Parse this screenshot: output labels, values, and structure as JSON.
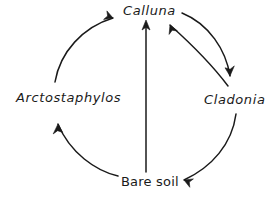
{
  "diagram": {
    "type": "cyclic-succession-diagram",
    "background_color": "#ffffff",
    "stroke_color": "#1a1a1a",
    "nodes": [
      {
        "id": "calluna",
        "label": "Calluna",
        "style": "italic",
        "position": "top"
      },
      {
        "id": "cladonia",
        "label": "Cladonia",
        "style": "italic",
        "position": "right"
      },
      {
        "id": "bare_soil",
        "label": "Bare soil",
        "style": "upright",
        "position": "bottom"
      },
      {
        "id": "arctostaphylos",
        "label": "Arctostaphylos",
        "style": "italic",
        "position": "left"
      }
    ],
    "edges": [
      {
        "from": "bare_soil",
        "to": "arctostaphylos",
        "shape": "arc",
        "direction": "counterclockwise"
      },
      {
        "from": "arctostaphylos",
        "to": "calluna",
        "shape": "arc",
        "direction": "counterclockwise"
      },
      {
        "from": "calluna",
        "to": "cladonia",
        "shape": "arc",
        "direction": "clockwise"
      },
      {
        "from": "cladonia",
        "to": "calluna",
        "shape": "arc",
        "direction": "counterclockwise"
      },
      {
        "from": "cladonia",
        "to": "bare_soil",
        "shape": "arc",
        "direction": "clockwise"
      },
      {
        "from": "bare_soil",
        "to": "calluna",
        "shape": "straight",
        "direction": "vertical"
      }
    ]
  }
}
